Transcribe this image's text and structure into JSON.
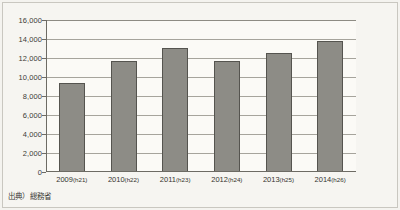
{
  "source_note": "出典）総務省",
  "chart_data": {
    "type": "bar",
    "title": "",
    "xlabel": "",
    "ylabel": "",
    "categories": [
      "2009(h21)",
      "2010(h22)",
      "2011(h23)",
      "2012(h24)",
      "2013(h25)",
      "2014(h26)"
    ],
    "category_years": [
      "2009",
      "2010",
      "2011",
      "2012",
      "2013",
      "2014"
    ],
    "category_eras": [
      "(h21)",
      "(h22)",
      "(h23)",
      "(h24)",
      "(h25)",
      "(h26)"
    ],
    "values": [
      9400,
      11700,
      13100,
      11700,
      12500,
      13800
    ],
    "ylim": [
      0,
      16000
    ],
    "ytick_step": 2000,
    "ytick_labels": [
      "16,000",
      "14,000",
      "12,000",
      "10,000",
      "8,000",
      "6,000",
      "4,000",
      "2,000",
      "0"
    ],
    "ytick_values": [
      16000,
      14000,
      12000,
      10000,
      8000,
      6000,
      4000,
      2000,
      0
    ],
    "grid": true,
    "legend": false,
    "bar_color": "#8d8c86",
    "bar_border_color": "#55544f",
    "gridline_color": "#a6a49c",
    "axis_color": "#6d6b64",
    "plot_background": "#fbfaf6",
    "page_background": "#f4f3ef"
  }
}
